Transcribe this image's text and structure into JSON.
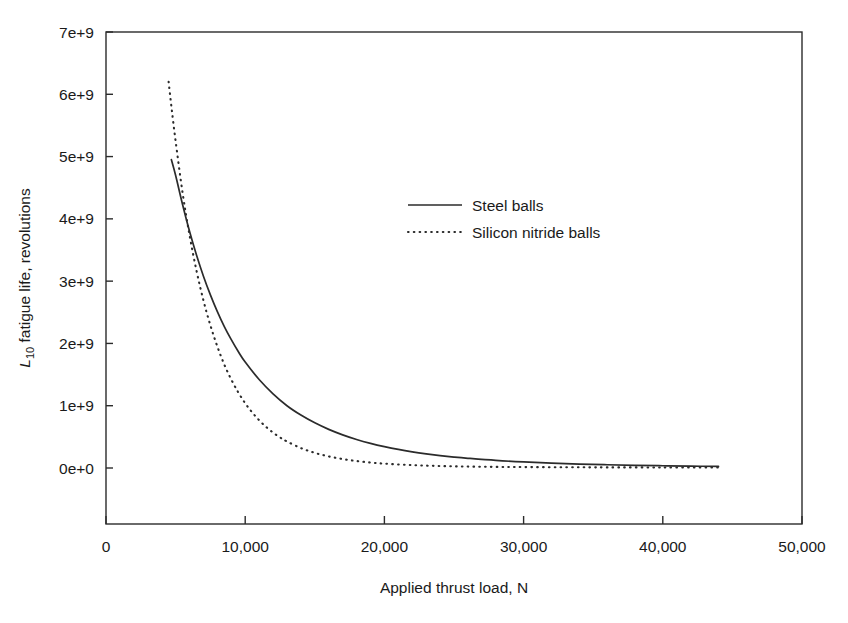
{
  "chart_data": {
    "type": "line",
    "title": "",
    "xlabel": "Applied thrust load, N",
    "ylabel": "L10 fatigue life, revolutions",
    "ylabel_parts": {
      "symbol": "L",
      "subscript": "10",
      "rest": " fatigue life, revolutions"
    },
    "xlim": [
      0,
      50000
    ],
    "ylim": [
      0,
      7000000000
    ],
    "xticks": [
      0,
      10000,
      20000,
      30000,
      40000,
      50000
    ],
    "xtick_labels": [
      "0",
      "10,000",
      "20,000",
      "30,000",
      "40,000",
      "50,000"
    ],
    "yticks": [
      0,
      1000000000,
      2000000000,
      3000000000,
      4000000000,
      5000000000,
      6000000000,
      7000000000
    ],
    "ytick_labels": [
      "0e+0",
      "1e+9",
      "2e+9",
      "3e+9",
      "4e+9",
      "5e+9",
      "6e+9",
      "7e+9"
    ],
    "grid": false,
    "legend_position": "upper-center-right",
    "series": [
      {
        "name": "Steel balls",
        "style": "solid",
        "color": "#2b2b2b",
        "x": [
          4700,
          5000,
          5500,
          6000,
          6500,
          7000,
          7500,
          8000,
          8500,
          9000,
          9500,
          10000,
          11000,
          12000,
          13000,
          14000,
          15000,
          16000,
          17000,
          18000,
          19000,
          20000,
          21000,
          22000,
          23000,
          24000,
          25000,
          26000,
          28000,
          30000,
          32000,
          34000,
          36000,
          38000,
          40000,
          42000,
          44000
        ],
        "y": [
          4950000000,
          4700000000,
          4230000000,
          3800000000,
          3420000000,
          3080000000,
          2780000000,
          2510000000,
          2270000000,
          2060000000,
          1870000000,
          1700000000,
          1420000000,
          1190000000,
          1000000000,
          850000000,
          725000000,
          620000000,
          532000000,
          458000000,
          396000000,
          343000000,
          298000000,
          260000000,
          228000000,
          200000000,
          176000000,
          156000000,
          122000000,
          97000000,
          78000000,
          63000000,
          52000000,
          43000000,
          36000000,
          30000000,
          26000000
        ]
      },
      {
        "name": "Silicon nitride balls",
        "style": "dotted",
        "color": "#2b2b2b",
        "x": [
          4500,
          4700,
          5000,
          5500,
          6000,
          6500,
          7000,
          7500,
          8000,
          8500,
          9000,
          9500,
          10000,
          10500,
          11000,
          11500,
          12000,
          12500,
          13000,
          14000,
          15000,
          16000,
          17000,
          18000,
          19000,
          20000,
          22000,
          24000,
          26000,
          28000,
          30000,
          33000,
          36000,
          40000,
          44000
        ],
        "y": [
          6200000000,
          5800000000,
          5250000000,
          4420000000,
          3740000000,
          3170000000,
          2690000000,
          2290000000,
          1950000000,
          1660000000,
          1420000000,
          1215000000,
          1040000000,
          893000000,
          767000000,
          660000000,
          569000000,
          492000000,
          426000000,
          320000000,
          243000000,
          186000000,
          144000000,
          112000000,
          88000000,
          70000000,
          46000000,
          32000000,
          23000000,
          18000000,
          15000000,
          12000000,
          10000000,
          9000000,
          8000000
        ]
      }
    ]
  },
  "legend": {
    "items": [
      {
        "label": "Steel balls",
        "style": "solid"
      },
      {
        "label": "Silicon nitride balls",
        "style": "dotted"
      }
    ]
  }
}
